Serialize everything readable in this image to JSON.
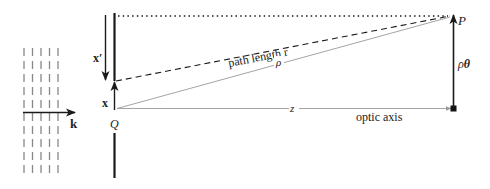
{
  "diagram": {
    "labels": {
      "wave_vector": "k",
      "displacement_prime": "x′",
      "displacement": "x",
      "source_point": "Q",
      "observation_point": "P",
      "path_length": "path length r",
      "rho": "ρ",
      "z": "z",
      "optic_axis": "optic axis",
      "rho_theta_rho": "ρ",
      "rho_theta_theta": "θ"
    },
    "colors": {
      "stroke_dark": "#1a1a1a",
      "stroke_light": "#9a9a9a",
      "wavefront": "#888888"
    }
  }
}
